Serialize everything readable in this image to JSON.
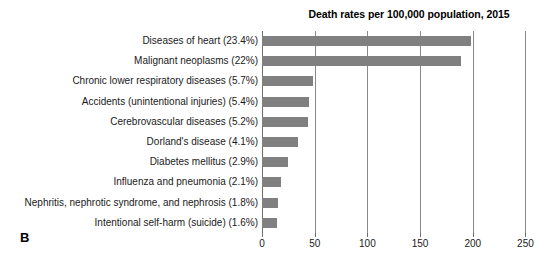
{
  "panel": {
    "letter": "B"
  },
  "chart_data": {
    "type": "bar",
    "orientation": "horizontal",
    "title": "Death rates per 100,000 population, 2015",
    "xlabel": "",
    "ylabel": "",
    "xlim": [
      0,
      260
    ],
    "ticks": [
      0,
      50,
      100,
      150,
      200,
      250
    ],
    "tick_labels": [
      "0",
      "50",
      "100",
      "150",
      "200",
      "250"
    ],
    "grid": true,
    "grid_axis": "x",
    "legend": null,
    "bar_color": "#808080",
    "categories": [
      "Diseases of heart (23.4%)",
      "Malignant neoplasms (22%)",
      "Chronic lower respiratory diseases (5.7%)",
      "Accidents (unintentional injuries) (5.4%)",
      "Cerebrovascular diseases (5.2%)",
      "Dorland's disease (4.1%)",
      "Diabetes mellitus (2.9%)",
      "Influenza and pneumonia (2.1%)",
      "Nephritis, nephrotic syndrome, and nephrosis (1.8%)",
      "Intentional self-harm (suicide) (1.6%)"
    ],
    "values": [
      198,
      189,
      48.6,
      45,
      44,
      34,
      25,
      18,
      15.5,
      14
    ],
    "percent_labels": [
      "23.4%",
      "22%",
      "5.7%",
      "5.4%",
      "5.2%",
      "4.1%",
      "2.9%",
      "2.1%",
      "1.8%",
      "1.6%"
    ]
  }
}
